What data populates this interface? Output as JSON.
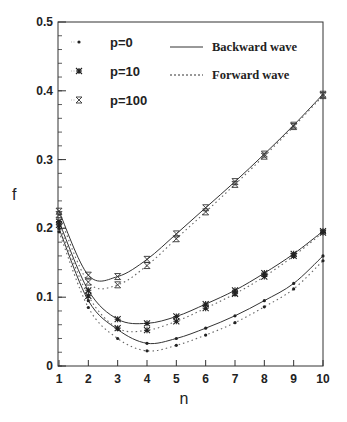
{
  "chart_data": {
    "type": "line",
    "title": "",
    "xlabel": "n",
    "ylabel": "f",
    "xlim": [
      1,
      10
    ],
    "ylim": [
      0,
      0.5
    ],
    "x_ticks": [
      "1",
      "2",
      "3",
      "4",
      "5",
      "6",
      "7",
      "8",
      "9",
      "10"
    ],
    "y_ticks": [
      "0",
      "0.1",
      "0.2",
      "0.3",
      "0.4",
      "0.5"
    ],
    "grid": false,
    "legend_position": "upper-left",
    "x": [
      1,
      2,
      3,
      4,
      5,
      6,
      7,
      8,
      9,
      10
    ],
    "legend": {
      "markers": [
        {
          "label": "p=0",
          "marker": "dot"
        },
        {
          "label": "p=10",
          "marker": "asterisk"
        },
        {
          "label": "p=100",
          "marker": "hourglass"
        }
      ],
      "lines": [
        {
          "label": "Backward wave",
          "style": "solid"
        },
        {
          "label": "Forward wave",
          "style": "dotted"
        }
      ]
    },
    "series": [
      {
        "name": "p=0 Backward wave",
        "values": [
          0.2,
          0.095,
          0.053,
          0.033,
          0.04,
          0.055,
          0.073,
          0.095,
          0.12,
          0.16
        ]
      },
      {
        "name": "p=0 Forward wave",
        "values": [
          0.195,
          0.085,
          0.04,
          0.022,
          0.03,
          0.045,
          0.063,
          0.086,
          0.112,
          0.153
        ]
      },
      {
        "name": "p=10 Backward wave",
        "values": [
          0.21,
          0.11,
          0.068,
          0.062,
          0.072,
          0.09,
          0.11,
          0.135,
          0.163,
          0.196
        ]
      },
      {
        "name": "p=10 Forward wave",
        "values": [
          0.205,
          0.102,
          0.055,
          0.052,
          0.065,
          0.084,
          0.105,
          0.13,
          0.16,
          0.194
        ]
      },
      {
        "name": "p=100 Backward wave",
        "values": [
          0.225,
          0.132,
          0.13,
          0.155,
          0.192,
          0.23,
          0.268,
          0.308,
          0.35,
          0.395
        ]
      },
      {
        "name": "p=100 Forward wave",
        "values": [
          0.22,
          0.122,
          0.118,
          0.146,
          0.185,
          0.224,
          0.264,
          0.305,
          0.348,
          0.393
        ]
      }
    ]
  }
}
